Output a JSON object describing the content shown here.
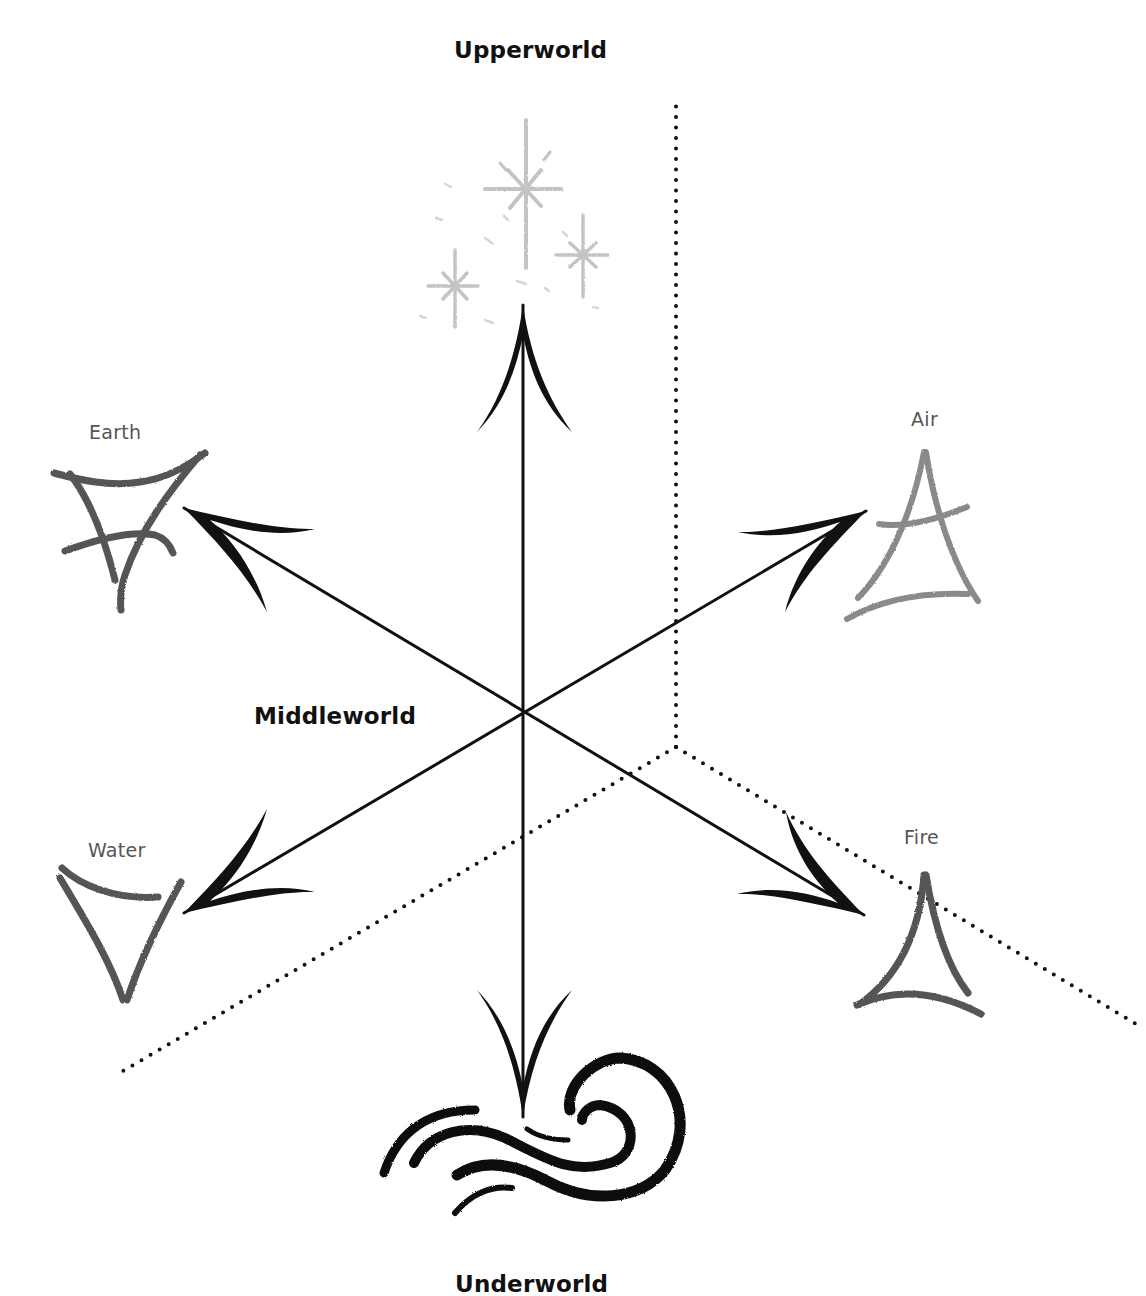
{
  "diagram": {
    "worlds": {
      "upper": {
        "label": "Upperworld",
        "icon": "stars-icon"
      },
      "middle": {
        "label": "Middleworld"
      },
      "lower": {
        "label": "Underworld",
        "icon": "wave-swirl-icon"
      }
    },
    "elements": [
      {
        "id": "earth",
        "label": "Earth",
        "icon": "earth-triangle-icon",
        "position": "upper-left"
      },
      {
        "id": "air",
        "label": "Air",
        "icon": "air-triangle-icon",
        "position": "upper-right"
      },
      {
        "id": "water",
        "label": "Water",
        "icon": "water-triangle-icon",
        "position": "lower-left"
      },
      {
        "id": "fire",
        "label": "Fire",
        "icon": "fire-triangle-icon",
        "position": "lower-right"
      }
    ],
    "center": {
      "x": 523,
      "y": 713
    },
    "arrows": [
      "up",
      "down",
      "upper-left",
      "upper-right",
      "lower-left",
      "lower-right"
    ],
    "dotted_axes_origin": {
      "x": 676,
      "y": 747
    },
    "colors": {
      "ink": "#111111",
      "element_ink": "#5a5a5a",
      "air_ink": "#8a8a8a",
      "stars_ink": "#c8c8c8",
      "background": "#ffffff"
    }
  }
}
